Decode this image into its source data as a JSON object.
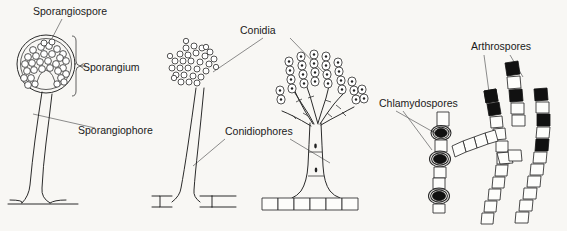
{
  "figure": {
    "background_color": "#f8f7f4",
    "ink_color": "#2b2b2b",
    "leader_color": "#6e6e6e",
    "spore_fill_color": "#111111",
    "width": 567,
    "height": 231
  },
  "labels": {
    "sporangiospore": "Sporangiospore",
    "sporangium": "Sporangium",
    "sporangiophore": "Sporangiophore",
    "conidia": "Conidia",
    "conidiophores": "Conidiophores",
    "chlamydospores": "Chlamydospores",
    "arthrospores": "Arthrospores"
  },
  "structures": [
    {
      "name": "sporangium-structure",
      "labels": [
        "Sporangiospore",
        "Sporangium",
        "Sporangiophore"
      ],
      "description": "Round sporangium with double wall packed with sporangiospores and an internal columella, borne on a long wavy sporangiophore arising from a basal hypha"
    },
    {
      "name": "conidial-head-structure",
      "labels": [
        "Conidia",
        "Conidiophores"
      ],
      "description": "Loose irregular cluster of round conidia on a slender conidiophore rising from a septate basal hypha"
    },
    {
      "name": "penicillium-conidiophore-structure",
      "labels": [
        "Conidia",
        "Conidiophores"
      ],
      "description": "Branched brush-like conidiophore bearing chains of oval conidia on phialides, with septate trunk and flared foot cell on a chain of rectangular hyphal cells"
    },
    {
      "name": "chlamydospore-structure",
      "labels": [
        "Chlamydospores"
      ],
      "description": "Vertical chain of rectangular hyphal cells bearing three thick-walled black chlamydospores each enclosed in a double ring"
    },
    {
      "name": "arthrospore-structure",
      "labels": [
        "Arthrospores"
      ],
      "description": "Branching septate hyphae of rectangular cells in which scattered cells have become solid black arthrospores"
    }
  ]
}
